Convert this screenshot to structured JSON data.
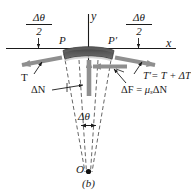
{
  "figure": {
    "caption": "(b)",
    "axes": {
      "x_label": "x",
      "y_label": "y"
    },
    "points": {
      "P": "P",
      "P_prime": "P′",
      "O": "O"
    },
    "angle_labels": {
      "left_numerator": "Δθ",
      "left_denominator": "2",
      "right_numerator": "Δθ",
      "right_denominator": "2",
      "center": "Δθ"
    },
    "forces": {
      "tension_left": "T",
      "tension_right_prefix": "T′",
      "tension_right_equation": "= T + ΔT",
      "normal": "ΔN",
      "friction_prefix": "ΔF",
      "friction_equation": "=",
      "friction_mu": "μ",
      "friction_mu_sub": "s",
      "friction_dn": "ΔN"
    },
    "colors": {
      "arrow_gray": "#8f8f8f",
      "band_dark": "#4a4a4a",
      "band_light": "#b9b9b9",
      "line_black": "#1a1a1a",
      "dashed": "#555555",
      "background": "#ffffff"
    }
  }
}
